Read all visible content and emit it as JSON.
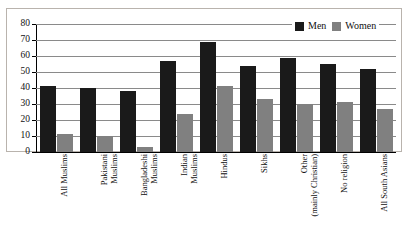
{
  "chart_data": {
    "type": "bar",
    "title": "",
    "xlabel": "",
    "ylabel": "",
    "ylim": [
      0,
      80
    ],
    "yticks": [
      0,
      10,
      20,
      30,
      40,
      50,
      60,
      70,
      80
    ],
    "grid": true,
    "legend_position": "top-right",
    "categories": [
      "All Muslims",
      "Pakistani Muslims",
      "Bangladeshi Muslims",
      "Indian Muslims",
      "Hindus",
      "Sikhs",
      "Other (mainly Christian)",
      "No religion",
      "All South Asians"
    ],
    "category_lines": [
      [
        "All Muslims",
        ""
      ],
      [
        "Pakistani",
        "Muslims"
      ],
      [
        "Bangladeshi",
        "Muslims"
      ],
      [
        "Indian",
        "Muslims"
      ],
      [
        "Hindus",
        ""
      ],
      [
        "Sikhs",
        ""
      ],
      [
        "Other",
        "(mainly Christian)"
      ],
      [
        "No religion",
        ""
      ],
      [
        "All South Asians",
        ""
      ]
    ],
    "series": [
      {
        "name": "Men",
        "color": "#1a1a1a",
        "values": [
          41,
          40,
          38,
          57,
          69,
          54,
          59,
          55,
          52
        ]
      },
      {
        "name": "Women",
        "color": "#808080",
        "values": [
          11,
          10,
          3,
          24,
          41,
          33,
          30,
          31,
          27
        ]
      }
    ]
  },
  "legend": {
    "men_label": "Men",
    "women_label": "Women"
  }
}
